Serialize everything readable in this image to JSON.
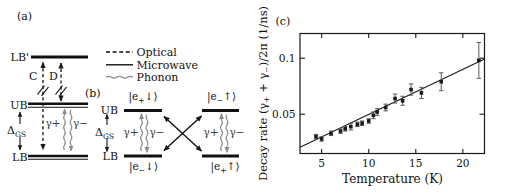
{
  "figure": {
    "panel_a": {
      "label": "(a)",
      "level_lbp": "LB'",
      "level_ub": "UB",
      "level_lb": "LB",
      "arrow_c": "C",
      "arrow_d": "D",
      "delta": {
        "base": "Δ",
        "sub": "GS"
      },
      "gamma_plus": "γ+",
      "gamma_minus": "γ−"
    },
    "legend": {
      "optical": "Optical",
      "microwave": "Microwave",
      "phonon": "Phonon"
    },
    "panel_b": {
      "label": "(b)",
      "level_ub": "UB",
      "level_lb": "LB",
      "delta": {
        "base": "Δ",
        "sub": "GS"
      },
      "left_pair": {
        "gamma_plus": "γ+",
        "gamma_minus": "γ−"
      },
      "right_pair": {
        "gamma_plus": "γ+",
        "gamma_minus": "γ−"
      },
      "ket_top_left": {
        "pre": "|e",
        "sub": "+",
        "post": "↓⟩"
      },
      "ket_top_right": {
        "pre": "|e",
        "sub": "−",
        "post": "↑⟩"
      },
      "ket_bottom_left": {
        "pre": "|e",
        "sub": "−",
        "post": "↓⟩"
      },
      "ket_bottom_right": {
        "pre": "|e",
        "sub": "+",
        "post": "↑⟩"
      }
    },
    "panel_c": {
      "label": "(c)"
    }
  },
  "chart_data": {
    "type": "scatter",
    "title": "",
    "xlabel": "Temperature (K)",
    "ylabel": "Decay rate (γ+ + γ−)/2π (1/ns)",
    "ylabel_parts": [
      "Decay rate (γ",
      "+",
      " + γ",
      "−",
      ")/2π (1/ns)"
    ],
    "xlim": [
      2.7,
      22.3
    ],
    "ylim": [
      0.015,
      0.122
    ],
    "xticks": [
      5,
      10,
      15,
      20
    ],
    "yticks": [
      0.05,
      0.1
    ],
    "ytick_labels": [
      "0.05",
      "0.1"
    ],
    "grid": false,
    "legend_position": "none",
    "marker": "filled-square",
    "points": [
      {
        "x": 4.4,
        "y": 0.03,
        "err": 0.002
      },
      {
        "x": 5.0,
        "y": 0.028,
        "err": 0.002
      },
      {
        "x": 6.0,
        "y": 0.033,
        "err": 0.002
      },
      {
        "x": 7.0,
        "y": 0.035,
        "err": 0.002
      },
      {
        "x": 7.5,
        "y": 0.037,
        "err": 0.002
      },
      {
        "x": 8.1,
        "y": 0.039,
        "err": 0.003
      },
      {
        "x": 8.8,
        "y": 0.041,
        "err": 0.002
      },
      {
        "x": 9.3,
        "y": 0.042,
        "err": 0.002
      },
      {
        "x": 10.0,
        "y": 0.044,
        "err": 0.002
      },
      {
        "x": 10.5,
        "y": 0.049,
        "err": 0.003
      },
      {
        "x": 10.9,
        "y": 0.052,
        "err": 0.003
      },
      {
        "x": 11.8,
        "y": 0.056,
        "err": 0.003
      },
      {
        "x": 12.8,
        "y": 0.064,
        "err": 0.004
      },
      {
        "x": 13.6,
        "y": 0.062,
        "err": 0.004
      },
      {
        "x": 14.5,
        "y": 0.072,
        "err": 0.005
      },
      {
        "x": 15.6,
        "y": 0.069,
        "err": 0.005
      },
      {
        "x": 17.7,
        "y": 0.079,
        "err": 0.008
      },
      {
        "x": 21.7,
        "y": 0.098,
        "err": 0.016
      }
    ],
    "fit_line": {
      "x1": 2.7,
      "y1": 0.0205,
      "x2": 22.3,
      "y2": 0.0993
    },
    "colors": {
      "marker": "#1a1a1a",
      "fit_line": "#1a1a1a",
      "error_bar": "#5a5a5a",
      "axis": "#1a1a1a",
      "phonon_gray": "#8c8c8c"
    }
  }
}
